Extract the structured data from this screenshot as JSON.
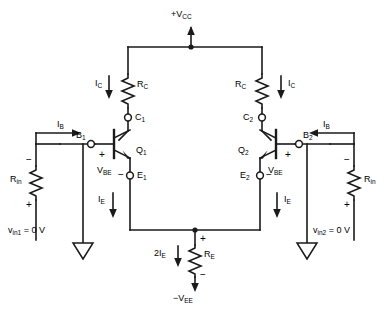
{
  "figure": {
    "type": "schematic",
    "background_color": "#ffffff",
    "line_color": "#1a1a1a"
  },
  "supplies": {
    "positive": {
      "label_prefix": "+V",
      "label_sub": "CC",
      "text": "+VCC"
    },
    "negative": {
      "label_prefix": "−V",
      "label_sub": "EE",
      "text": "−VEE"
    }
  },
  "resistors": {
    "collector_left": {
      "name": "R",
      "sub": "C"
    },
    "collector_right": {
      "name": "R",
      "sub": "C"
    },
    "emitter": {
      "name": "R",
      "sub": "E"
    },
    "input_left": {
      "name": "R",
      "sub": "in"
    },
    "input_right": {
      "name": "R",
      "sub": "in"
    }
  },
  "transistors": {
    "left": {
      "name": "Q",
      "sub": "1",
      "base_label": "B",
      "base_sub": "1",
      "collector_label": "C",
      "collector_sub": "1",
      "emitter_label": "E",
      "emitter_sub": "1",
      "vbe_label": "V",
      "vbe_sub": "BE"
    },
    "right": {
      "name": "Q",
      "sub": "2",
      "base_label": "B",
      "base_sub": "2",
      "collector_label": "C",
      "collector_sub": "2",
      "emitter_label": "E",
      "emitter_sub": "2",
      "vbe_label": "V",
      "vbe_sub": "BE"
    }
  },
  "currents": {
    "collector_left": {
      "name": "I",
      "sub": "C",
      "direction": "down"
    },
    "collector_right": {
      "name": "I",
      "sub": "C",
      "direction": "down"
    },
    "base_left": {
      "name": "I",
      "sub": "B",
      "direction": "right"
    },
    "base_right": {
      "name": "I",
      "sub": "B",
      "direction": "left"
    },
    "emitter_left": {
      "name": "I",
      "sub": "E",
      "direction": "down"
    },
    "emitter_right": {
      "name": "I",
      "sub": "E",
      "direction": "down"
    },
    "emitter_total": {
      "prefix": "2I",
      "sub": "E",
      "direction": "down"
    }
  },
  "sources": {
    "left": {
      "name": "v",
      "sub": "in1",
      "value": "= 0 V",
      "text": "vin1 = 0 V"
    },
    "right": {
      "name": "v",
      "sub": "in2",
      "value": "= 0 V",
      "text": "vin2 = 0 V"
    }
  },
  "polarities": {
    "plus": "+",
    "minus": "−"
  },
  "grounds": {
    "left": "ground-symbol",
    "right": "ground-symbol"
  }
}
